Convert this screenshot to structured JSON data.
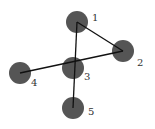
{
  "diagram": {
    "type": "graph",
    "node_color": "#555555",
    "edge_color": "#111111",
    "nodes": [
      {
        "id": "1",
        "label": "1",
        "cx": 77,
        "cy": 22,
        "r": 11,
        "lx": 92,
        "ly": 21
      },
      {
        "id": "2",
        "label": "2",
        "cx": 123,
        "cy": 51,
        "r": 11,
        "lx": 137,
        "ly": 66
      },
      {
        "id": "3",
        "label": "3",
        "cx": 73,
        "cy": 68,
        "r": 11,
        "lx": 84,
        "ly": 80
      },
      {
        "id": "4",
        "label": "4",
        "cx": 20,
        "cy": 73,
        "r": 11,
        "lx": 31,
        "ly": 86
      },
      {
        "id": "5",
        "label": "5",
        "cx": 73,
        "cy": 108,
        "r": 11,
        "lx": 88,
        "ly": 115
      }
    ],
    "edges": [
      {
        "from": "1",
        "to": "2"
      },
      {
        "from": "1",
        "to": "5"
      },
      {
        "from": "4",
        "to": "2"
      }
    ]
  }
}
